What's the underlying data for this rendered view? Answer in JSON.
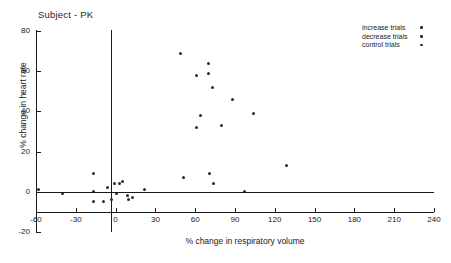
{
  "chart_data": {
    "type": "scatter",
    "title": "Subject - PK",
    "xlabel": "% change in respiratory volume",
    "ylabel": "% change in heart rate",
    "xlim": [
      -60,
      240
    ],
    "ylim": [
      -20,
      80
    ],
    "xticks": [
      -60,
      -30,
      0,
      30,
      60,
      90,
      120,
      150,
      180,
      210,
      240
    ],
    "yticks": [
      -20,
      0,
      20,
      40,
      60,
      80
    ],
    "xtick_labels": [
      "-60",
      "-30",
      "0",
      "30",
      "60",
      "90",
      "120",
      "150",
      "180",
      "210",
      "240"
    ],
    "ytick_labels": [
      "-20",
      "0",
      "20",
      "40",
      "60",
      "80"
    ],
    "grid": false,
    "reference_lines": [
      {
        "name": "zero-vertical",
        "axis": "x",
        "value": 0
      },
      {
        "name": "zero-horizontal",
        "axis": "y",
        "value": 0
      }
    ],
    "legend": {
      "position": "top-right",
      "entries": [
        {
          "label": "increase trials",
          "marker": "dot",
          "color": "#2b2b2b"
        },
        {
          "label": "decrease trials",
          "marker": "dot",
          "color": "#2b2b2b"
        },
        {
          "label": "control trials",
          "marker": "dot",
          "color": "#2b2b2b"
        }
      ]
    },
    "points": [
      {
        "x": 49,
        "y": 69
      },
      {
        "x": 70,
        "y": 64
      },
      {
        "x": 70,
        "y": 59
      },
      {
        "x": 61,
        "y": 58
      },
      {
        "x": 73,
        "y": 52
      },
      {
        "x": 88,
        "y": 46
      },
      {
        "x": 64,
        "y": 38
      },
      {
        "x": 104,
        "y": 39
      },
      {
        "x": 80,
        "y": 33
      },
      {
        "x": 61,
        "y": 32
      },
      {
        "x": 129,
        "y": 13
      },
      {
        "x": 71,
        "y": 9
      },
      {
        "x": 74,
        "y": 4
      },
      {
        "x": 51,
        "y": 7
      },
      {
        "x": -17,
        "y": 9
      },
      {
        "x": -58,
        "y": 1
      },
      {
        "x": -40,
        "y": -1
      },
      {
        "x": -17,
        "y": 0
      },
      {
        "x": -17,
        "y": -5
      },
      {
        "x": -6,
        "y": 2
      },
      {
        "x": -1,
        "y": 4
      },
      {
        "x": 3,
        "y": 4
      },
      {
        "x": 5,
        "y": 5
      },
      {
        "x": 1,
        "y": -1
      },
      {
        "x": -3,
        "y": -4
      },
      {
        "x": -9,
        "y": -5
      },
      {
        "x": 9,
        "y": -2
      },
      {
        "x": 10,
        "y": -4
      },
      {
        "x": 13,
        "y": -3
      },
      {
        "x": 22,
        "y": 1
      },
      {
        "x": 97,
        "y": 0
      }
    ]
  }
}
